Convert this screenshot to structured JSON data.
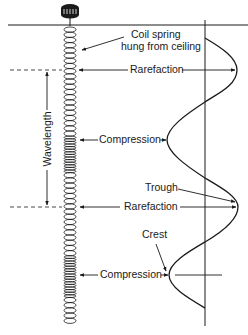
{
  "diagram": {
    "labels": {
      "coil_spring_line1": "Coil spring",
      "coil_spring_line2": "hung from ceiling",
      "rarefaction_1": "Rarefaction",
      "compression_1": "Compression",
      "trough": "Trough",
      "rarefaction_2": "Rarefaction",
      "crest": "Crest",
      "compression_2": "Compression",
      "wavelength": "Wavelength"
    },
    "colors": {
      "ink": "#1a1a1a",
      "background": "#ffffff"
    },
    "elements": {
      "ceiling_y": 25,
      "spring_center_x": 70,
      "spring_top_y": 25,
      "spring_bottom_y": 320,
      "compression_zones_y": [
        [
          133,
          172
        ],
        [
          255,
          295
        ]
      ],
      "axis_x": 205,
      "wave_points": [
        {
          "name": "start",
          "x": 205,
          "y": 38
        },
        {
          "name": "rarefaction-peak",
          "x": 237,
          "y": 70
        },
        {
          "name": "compression-peak",
          "x": 167,
          "y": 140
        },
        {
          "name": "trough",
          "x": 238,
          "y": 207
        },
        {
          "name": "crest",
          "x": 169,
          "y": 275
        },
        {
          "name": "end",
          "x": 205,
          "y": 308
        }
      ],
      "wavelength_span_y": [
        70,
        207
      ]
    }
  }
}
